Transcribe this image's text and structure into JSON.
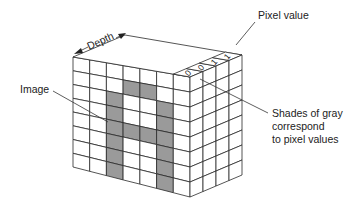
{
  "diagram": {
    "title": "",
    "labels": {
      "pixel_value": "Pixel value",
      "depth": "Depth",
      "image": "Image",
      "shades_line1": "Shades of gray",
      "shades_line2": "correspond",
      "shades_line3": "to pixel values"
    },
    "depth_values": [
      "0",
      "0",
      "1",
      "1"
    ],
    "grid": {
      "columns": 7,
      "rows": 8,
      "depth_cells": 4,
      "colors": {
        "on": "#9a9a9a",
        "off": "#ffffff",
        "line": "#2a2a2a"
      },
      "front_face_pattern": [
        [
          0,
          0,
          0,
          0,
          0,
          0,
          0
        ],
        [
          0,
          0,
          0,
          1,
          1,
          0,
          0
        ],
        [
          0,
          0,
          1,
          0,
          0,
          1,
          0
        ],
        [
          0,
          0,
          1,
          0,
          0,
          1,
          0
        ],
        [
          0,
          0,
          1,
          1,
          1,
          1,
          0
        ],
        [
          0,
          0,
          1,
          0,
          0,
          1,
          0
        ],
        [
          0,
          0,
          1,
          0,
          0,
          1,
          0
        ],
        [
          0,
          0,
          1,
          0,
          0,
          1,
          0
        ]
      ]
    }
  }
}
